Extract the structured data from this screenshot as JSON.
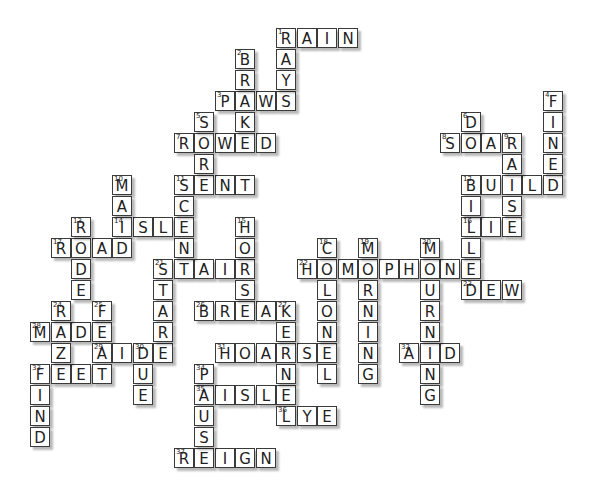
{
  "puzzle": {
    "type": "crossword",
    "grid": {
      "origin_x": 30,
      "origin_y": 28,
      "col_pitch": 20.5,
      "row_pitch": 21,
      "col_offset": 12
    },
    "colors": {
      "cell_bg": "#ffffff",
      "border": "#3a3a3a",
      "text": "#222222"
    },
    "across": [
      {
        "num": 1,
        "answer": "RAIN",
        "col": 0,
        "row": 0
      },
      {
        "num": 3,
        "answer": "PAWS",
        "col": -3,
        "row": 3
      },
      {
        "num": 7,
        "answer": "ROWED",
        "col": -5,
        "row": 5
      },
      {
        "num": 8,
        "answer": "SOAR",
        "col": 8,
        "row": 5
      },
      {
        "num": 11,
        "answer": "SENT",
        "col": -5,
        "row": 7
      },
      {
        "num": 12,
        "answer": "BUILD",
        "col": 9,
        "row": 7
      },
      {
        "num": 14,
        "answer": "ISLE",
        "col": -8,
        "row": 9
      },
      {
        "num": 16,
        "answer": "LIE",
        "col": 9,
        "row": 9
      },
      {
        "num": 17,
        "answer": "ROAD",
        "col": -11,
        "row": 10
      },
      {
        "num": 21,
        "answer": "STAIR",
        "col": -6,
        "row": 11
      },
      {
        "num": 22,
        "answer": "HOMOPHONE",
        "col": 1,
        "row": 11
      },
      {
        "num": 23,
        "answer": "DEW",
        "col": 9,
        "row": 12
      },
      {
        "num": 26,
        "answer": "BREAK",
        "col": -4,
        "row": 13
      },
      {
        "num": 28,
        "answer": "MADE",
        "col": -12,
        "row": 14
      },
      {
        "num": 29,
        "answer": "AIDE",
        "col": -9,
        "row": 15
      },
      {
        "num": 31,
        "answer": "HOARSE",
        "col": -3,
        "row": 15
      },
      {
        "num": 32,
        "answer": "AID",
        "col": 6,
        "row": 15
      },
      {
        "num": 33,
        "answer": "FEET",
        "col": -12,
        "row": 16
      },
      {
        "num": 35,
        "answer": "AISLE",
        "col": -4,
        "row": 17
      },
      {
        "num": 36,
        "answer": "LYE",
        "col": 0,
        "row": 18
      },
      {
        "num": 37,
        "answer": "REIGN",
        "col": -5,
        "row": 20
      }
    ],
    "down": [
      {
        "num": 1,
        "answer": "RAYS",
        "col": 0,
        "row": 0
      },
      {
        "num": 2,
        "answer": "BRAKE",
        "col": -2,
        "row": 1
      },
      {
        "num": 4,
        "answer": "FINED",
        "col": 13,
        "row": 3
      },
      {
        "num": 5,
        "answer": "SORE",
        "col": -4,
        "row": 4
      },
      {
        "num": 6,
        "answer": "DO",
        "col": 9,
        "row": 4
      },
      {
        "num": 9,
        "answer": "RAISE",
        "col": 11,
        "row": 5
      },
      {
        "num": 10,
        "answer": "MAID",
        "col": -8,
        "row": 7
      },
      {
        "num": 11,
        "answer": "SCENT",
        "col": -5,
        "row": 7
      },
      {
        "num": 12,
        "answer": "BILLED",
        "col": 9,
        "row": 7
      },
      {
        "num": 13,
        "answer": "RODE",
        "col": -10,
        "row": 9
      },
      {
        "num": 15,
        "answer": "HORSE",
        "col": -2,
        "row": 9
      },
      {
        "num": 18,
        "answer": "COLONEL",
        "col": 2,
        "row": 10
      },
      {
        "num": 19,
        "answer": "MORNING",
        "col": 4,
        "row": 10
      },
      {
        "num": 20,
        "answer": "MOURNING",
        "col": 7,
        "row": 10
      },
      {
        "num": 21,
        "answer": "STARE",
        "col": -6,
        "row": 11
      },
      {
        "num": 24,
        "answer": "RAZE",
        "col": -11,
        "row": 13
      },
      {
        "num": 25,
        "answer": "FEAT",
        "col": -9,
        "row": 13
      },
      {
        "num": 27,
        "answer": "KERNEL",
        "col": 0,
        "row": 13
      },
      {
        "num": 30,
        "answer": "DUE",
        "col": -7,
        "row": 15
      },
      {
        "num": 33,
        "answer": "FIND",
        "col": -12,
        "row": 16
      },
      {
        "num": 34,
        "answer": "PAUSE",
        "col": -4,
        "row": 16
      }
    ]
  }
}
